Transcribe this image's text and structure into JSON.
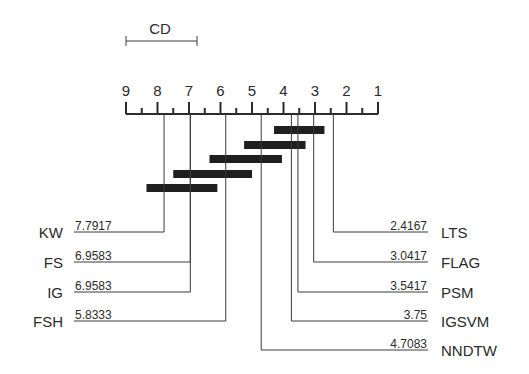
{
  "chart_data": {
    "type": "critical-difference-diagram",
    "title": "",
    "cd_label": "CD",
    "cd_value": 2.3,
    "axis": {
      "ticks": [
        9,
        8,
        7,
        6,
        5,
        4,
        3,
        2,
        1
      ],
      "range": [
        9,
        1
      ],
      "reversed": true,
      "minor_ticks": true
    },
    "methods_left": [
      {
        "name": "KW",
        "rank": 7.7917,
        "rank_label": "7.7917"
      },
      {
        "name": "FS",
        "rank": 6.9583,
        "rank_label": "6.9583"
      },
      {
        "name": "IG",
        "rank": 6.9583,
        "rank_label": "6.9583"
      },
      {
        "name": "FSH",
        "rank": 5.8333,
        "rank_label": "5.8333"
      }
    ],
    "methods_right": [
      {
        "name": "LTS",
        "rank": 2.4167,
        "rank_label": "2.4167"
      },
      {
        "name": "FLAG",
        "rank": 3.0417,
        "rank_label": "3.0417"
      },
      {
        "name": "PSM",
        "rank": 3.5417,
        "rank_label": "3.5417"
      },
      {
        "name": "IGSVM",
        "rank": 3.75,
        "rank_label": "3.75"
      },
      {
        "name": "NNDTW",
        "rank": 4.7083,
        "rank_label": "4.7083"
      }
    ],
    "cliques": [
      {
        "from": 4.3,
        "to": 2.7
      },
      {
        "from": 5.25,
        "to": 3.3
      },
      {
        "from": 6.35,
        "to": 4.05
      },
      {
        "from": 7.5,
        "to": 5.0
      },
      {
        "from": 8.35,
        "to": 6.1
      }
    ],
    "colors": {
      "bar": "#1f1f1f",
      "line": "#3a3a3a",
      "text": "#2b2b2b"
    }
  }
}
